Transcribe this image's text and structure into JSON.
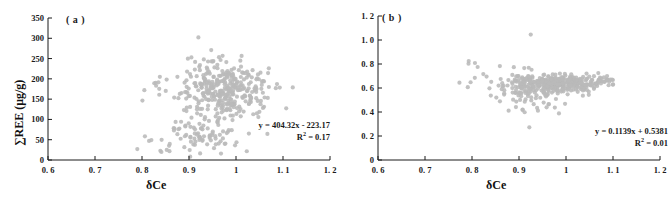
{
  "figure": {
    "background": "#ffffff",
    "marker_color": "#b9b9b9",
    "axis_color": "#1a1a1a"
  },
  "chart_data": [
    {
      "type": "scatter",
      "panel_label": "( a )",
      "title": "",
      "xlabel": "δCe",
      "ylabel": "∑REE (μg/g)",
      "xlim": [
        0.6,
        1.2
      ],
      "ylim": [
        0,
        350
      ],
      "xticks": [
        "0. 6",
        "0. 7",
        "0. 8",
        "0. 9",
        "1",
        "1. 1",
        "1. 2"
      ],
      "xtick_values": [
        0.6,
        0.7,
        0.8,
        0.9,
        1.0,
        1.1,
        1.2
      ],
      "yticks": [
        "0",
        "50",
        "100",
        "150",
        "200",
        "250",
        "300",
        "350"
      ],
      "ytick_values": [
        0,
        50,
        100,
        150,
        200,
        250,
        300,
        350
      ],
      "grid": false,
      "legend": "none",
      "annotations": {
        "equation": "y = 404.32x - 223.17",
        "r_squared_prefix": "R",
        "r_squared_exponent": "2",
        "r_squared_value": " = 0.17"
      },
      "fit": {
        "slope": 404.32,
        "intercept": -223.17,
        "r2": 0.17
      },
      "n_points": 430,
      "point_clusters": [
        {
          "name": "main-dense",
          "n": 300,
          "x_center": 0.975,
          "x_spread": 0.045,
          "y_center": 178,
          "y_spread": 33,
          "seed": 11
        },
        {
          "name": "low-ree-band",
          "n": 70,
          "x_center": 0.925,
          "x_spread": 0.04,
          "y_center": 55,
          "y_spread": 22,
          "seed": 29
        },
        {
          "name": "mid-scatter",
          "n": 45,
          "x_center": 0.955,
          "x_spread": 0.055,
          "y_center": 120,
          "y_spread": 35,
          "seed": 47
        },
        {
          "name": "left-outliers",
          "n": 12,
          "x_center": 0.825,
          "x_spread": 0.03,
          "y_center": 140,
          "y_spread": 65,
          "seed": 67
        },
        {
          "name": "right-tail",
          "n": 10,
          "x_center": 1.055,
          "x_spread": 0.02,
          "y_center": 160,
          "y_spread": 35,
          "seed": 83
        }
      ],
      "named_outliers": [
        {
          "x": 0.92,
          "y": 302
        },
        {
          "x": 0.79,
          "y": 27
        },
        {
          "x": 0.815,
          "y": 47
        },
        {
          "x": 0.82,
          "y": 49
        },
        {
          "x": 0.83,
          "y": 183
        },
        {
          "x": 0.838,
          "y": 205
        },
        {
          "x": 0.805,
          "y": 172
        }
      ]
    },
    {
      "type": "scatter",
      "panel_label": "( b )",
      "title": "",
      "xlabel": "δCe",
      "ylabel": "δEu",
      "xlim": [
        0.6,
        1.2
      ],
      "ylim": [
        0,
        1.2
      ],
      "xticks": [
        "0. 6",
        "0. 7",
        "0. 8",
        "0. 9",
        "1",
        "1. 1",
        "1. 2"
      ],
      "xtick_values": [
        0.6,
        0.7,
        0.8,
        0.9,
        1.0,
        1.1,
        1.2
      ],
      "yticks": [
        "0",
        "0. 2",
        "0. 4",
        "0. 6",
        "0. 8",
        "1. 0",
        "1. 2"
      ],
      "ytick_values": [
        0,
        0.2,
        0.4,
        0.6,
        0.8,
        1.0,
        1.2
      ],
      "grid": false,
      "legend": "none",
      "annotations": {
        "equation": "y = 0.1139x + 0.5381",
        "r_squared_prefix": "R",
        "r_squared_exponent": "2",
        "r_squared_value": " = 0.01"
      },
      "fit": {
        "slope": 0.1139,
        "intercept": 0.5381,
        "r2": 0.01
      },
      "n_points": 430,
      "point_clusters": [
        {
          "name": "main-band",
          "n": 320,
          "x_center": 0.985,
          "x_spread": 0.05,
          "y_center": 0.638,
          "y_spread": 0.035,
          "seed": 13
        },
        {
          "name": "left-shoulder",
          "n": 70,
          "x_center": 0.915,
          "x_spread": 0.025,
          "y_center": 0.6,
          "y_spread": 0.07,
          "seed": 31
        },
        {
          "name": "low-tail",
          "n": 25,
          "x_center": 0.925,
          "x_spread": 0.03,
          "y_center": 0.5,
          "y_spread": 0.05,
          "seed": 53
        },
        {
          "name": "left-outliers",
          "n": 10,
          "x_center": 0.82,
          "x_spread": 0.025,
          "y_center": 0.67,
          "y_spread": 0.09,
          "seed": 71
        }
      ],
      "named_outliers": [
        {
          "x": 0.925,
          "y": 1.045
        },
        {
          "x": 0.793,
          "y": 0.825
        },
        {
          "x": 0.812,
          "y": 0.775
        },
        {
          "x": 0.806,
          "y": 0.685
        },
        {
          "x": 0.797,
          "y": 0.648
        },
        {
          "x": 0.791,
          "y": 0.607
        },
        {
          "x": 0.922,
          "y": 0.272
        },
        {
          "x": 0.985,
          "y": 0.388
        },
        {
          "x": 0.912,
          "y": 0.398
        },
        {
          "x": 0.998,
          "y": 0.468
        }
      ]
    }
  ]
}
